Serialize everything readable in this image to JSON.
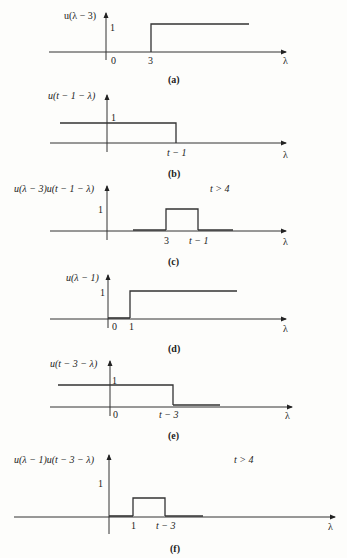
{
  "figure": {
    "panels": [
      {
        "id": "a",
        "caption": "(a)",
        "ylabel": "u(λ − 3)",
        "level_label": "1",
        "ticks": [
          "0",
          "3"
        ],
        "xlabel": "λ",
        "condition": ""
      },
      {
        "id": "b",
        "caption": "(b)",
        "ylabel": "u(t − 1 − λ)",
        "level_label": "1",
        "ticks": [
          "t − 1"
        ],
        "xlabel": "λ",
        "condition": ""
      },
      {
        "id": "c",
        "caption": "(c)",
        "ylabel": "u(λ − 3)u(t − 1 − λ)",
        "level_label": "1",
        "ticks": [
          "3",
          "t − 1"
        ],
        "xlabel": "λ",
        "condition": "t > 4"
      },
      {
        "id": "d",
        "caption": "(d)",
        "ylabel": "u(λ − 1)",
        "level_label": "1",
        "ticks": [
          "0",
          "1"
        ],
        "xlabel": "λ",
        "condition": ""
      },
      {
        "id": "e",
        "caption": "(e)",
        "ylabel": "u(t − 3 − λ)",
        "level_label": "1",
        "ticks": [
          "0",
          "t − 3"
        ],
        "xlabel": "λ",
        "condition": ""
      },
      {
        "id": "f",
        "caption": "(f)",
        "ylabel": "u(λ − 1)u(t − 3 − λ)",
        "level_label": "1",
        "ticks": [
          "1",
          "t − 3"
        ],
        "xlabel": "λ",
        "condition": "t > 4"
      }
    ]
  }
}
